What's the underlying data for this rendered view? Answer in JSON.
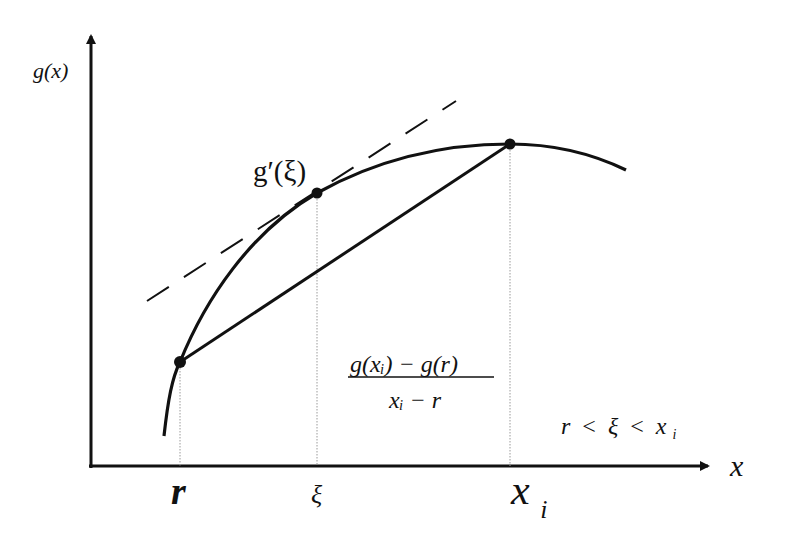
{
  "diagram": {
    "axes": {
      "y_label": "g(x)",
      "x_label": "x"
    },
    "points": {
      "r": {
        "label": "r",
        "px": [
          180,
          362
        ]
      },
      "xi": {
        "label": "ξ",
        "px": [
          317,
          193
        ]
      },
      "x_i": {
        "label": "x",
        "subscript": "i",
        "px": [
          510,
          144
        ]
      }
    },
    "labels": {
      "tangent_label": "g′(ξ)",
      "secant_numerator": "g(xᵢ) − g(r)",
      "secant_denominator": "xᵢ − r",
      "inequality_r": "r",
      "inequality_lt1": "<",
      "inequality_xi": "ξ",
      "inequality_lt2": "<",
      "inequality_x": "x",
      "inequality_sub": "i",
      "tick_r": "r",
      "tick_xi": "ξ",
      "tick_x": "x",
      "tick_sub": "i"
    },
    "colors": {
      "stroke": "#111111",
      "guide": "#9a9a9a",
      "background": "#ffffff"
    }
  }
}
